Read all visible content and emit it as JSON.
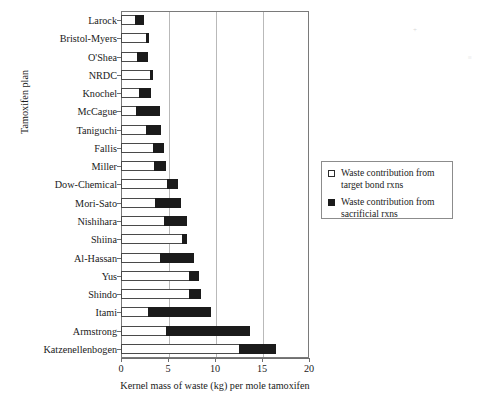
{
  "chart_data": {
    "type": "bar",
    "orientation": "horizontal",
    "stacked": true,
    "title": "",
    "xlabel": "Kernel mass of waste (kg) per mole tamoxifen",
    "ylabel": "Tamoxifen plan",
    "xlim": [
      0,
      20
    ],
    "xticks": [
      0,
      5,
      10,
      15,
      20
    ],
    "xtick_labels": [
      "0",
      "5",
      "10",
      "15",
      "20"
    ],
    "grid": "vertical",
    "legend_position": "right-middle",
    "categories": [
      "Larock",
      "Bristol-Myers",
      "O'Shea",
      "NRDC",
      "Knochel",
      "McCague",
      "Taniguchi",
      "Fallis",
      "Miller",
      "Dow-Chemical",
      "Mori-Sato",
      "Nishihara",
      "Shiina",
      "Al-Hassan",
      "Yus",
      "Shindo",
      "Itami",
      "Armstrong",
      "Katzenellenbogen"
    ],
    "series": [
      {
        "name": "Waste contribution from target bond rxns",
        "color": "#ffffff",
        "values": [
          1.5,
          2.7,
          1.7,
          3.1,
          1.9,
          1.6,
          2.7,
          3.4,
          3.5,
          4.9,
          3.6,
          4.6,
          6.5,
          4.2,
          7.2,
          7.2,
          2.9,
          4.8,
          12.6
        ]
      },
      {
        "name": "Waste contribution from sacrificial rxns",
        "color": "#1b1b1b",
        "values": [
          0.9,
          0.3,
          1.2,
          0.3,
          1.3,
          2.6,
          1.6,
          1.2,
          1.3,
          1.2,
          2.8,
          2.4,
          0.5,
          3.6,
          1.1,
          1.3,
          6.7,
          8.9,
          3.9
        ]
      }
    ],
    "totals": [
      2.4,
      3.0,
      2.9,
      3.4,
      3.2,
      4.2,
      4.3,
      4.6,
      4.8,
      6.1,
      6.4,
      7.0,
      7.0,
      7.8,
      8.3,
      8.5,
      9.6,
      13.7,
      16.5
    ]
  },
  "legend": {
    "entries": [
      {
        "swatch": "open-square-icon",
        "line1": "Waste contribution from",
        "line2": "target bond rxns"
      },
      {
        "swatch": "filled-square-icon",
        "line1": "Waste contribution from",
        "line2": "sacrificial rxns"
      }
    ]
  },
  "artifacts": {
    "mark_top": "+",
    "mark_side": "≡"
  }
}
